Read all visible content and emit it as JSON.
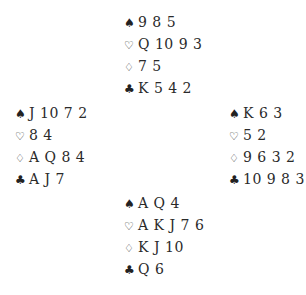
{
  "diagram": {
    "type": "bridge-deal",
    "hands": {
      "north": {
        "spades": "9 8 5",
        "hearts": "Q 10 9 3",
        "diamonds": "7 5",
        "clubs": "K 5 4 2"
      },
      "west": {
        "spades": "J 10 7 2",
        "hearts": "8 4",
        "diamonds": "A Q 8 4",
        "clubs": "A J 7"
      },
      "east": {
        "spades": "K 6 3",
        "hearts": "5 2",
        "diamonds": "9 6 3 2",
        "clubs": "10 9 8 3"
      },
      "south": {
        "spades": "A Q 4",
        "hearts": "A K J 7 6",
        "diamonds": "K J 10",
        "clubs": "Q 6"
      }
    },
    "suit_symbols": {
      "spades": "♠",
      "hearts": "♡",
      "diamonds": "♢",
      "clubs": "♣"
    }
  }
}
